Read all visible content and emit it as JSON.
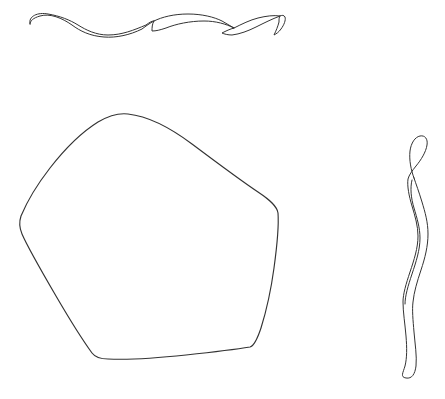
{
  "canvas": {
    "title": "Hand-drawn ink shapes",
    "width": 445,
    "height": 399,
    "background_color": "#ffffff",
    "ink_color": "#333333",
    "stroke_width": 1.15,
    "medium": "pen-line-drawing",
    "shape_count": 3
  },
  "shapes": [
    {
      "id": "looping-ribbon-horizontal",
      "name": "Horizontal looping ribbon",
      "description": "A chain of four elongated overlapping lens-shaped loops running left to right near the top of the canvas, beginning with a rounded bow at the left and ending in a small sharp hook at the right.",
      "closed": false,
      "bbox": {
        "x": 28,
        "y": 10,
        "width": 258,
        "height": 32
      },
      "loop_count": 4,
      "crossing_points_x": [
        78,
        152,
        210,
        272
      ],
      "path": "M 30 24 C 28 16, 38 12, 48 14 C 60 16, 70 20, 78 25 C 86 30, 96 35, 108 35 C 122 35, 134 30, 146 25 C 150 22, 152 21, 154 21 C 150 23, 146 26, 142 29 C 130 35, 116 38, 104 37 C 90 36, 80 31, 72 25 C 62 18, 50 13, 40 16 C 33 18, 30 21, 30 24 Z M 154 21 C 162 17, 174 14, 188 14 C 202 14, 214 17, 222 21 C 226 23, 230 26, 234 28 C 226 24, 216 21, 204 21 C 190 21, 176 24, 166 28 C 160 30, 156 31, 152 31 C 152 28, 152 24, 154 21 Z M 234 28 C 242 24, 250 20, 258 18 C 266 16, 274 15, 280 16 C 272 19, 264 23, 256 27 C 248 31, 240 34, 232 35 C 228 35, 224 34, 222 33 C 226 31, 230 29, 234 28 Z M 280 16 C 282 15, 284 15, 285 17 C 286 20, 284 25, 281 29 C 279 32, 276 34, 274 35 C 276 31, 278 26, 279 22 C 279 19, 279 17, 280 16 Z"
    },
    {
      "id": "rounded-pentagon",
      "name": "Large rounded pentagon",
      "description": "A large closed hand-drawn pentagon-like blob with five softly rounded corners: top apex, upper-left shoulder, upper-right shoulder, bottom-left corner and bottom-right corner.",
      "closed": true,
      "bbox": {
        "x": 20,
        "y": 112,
        "width": 260,
        "height": 250
      },
      "vertices": [
        {
          "label": "top-apex",
          "x": 128,
          "y": 114
        },
        {
          "label": "right-shoulder",
          "x": 278,
          "y": 210
        },
        {
          "label": "bottom-right",
          "x": 252,
          "y": 345
        },
        {
          "label": "bottom-left",
          "x": 100,
          "y": 359
        },
        {
          "label": "left-corner",
          "x": 20,
          "y": 222
        }
      ],
      "path": "M 128 114 C 146 116, 168 126, 192 144 C 216 162, 240 180, 258 192 C 270 200, 277 206, 278 213 C 279 226, 277 246, 274 268 C 271 290, 266 312, 261 328 C 257 340, 254 346, 250 347 C 238 349, 214 352, 186 355 C 158 358, 128 360, 108 359 C 100 359, 95 357, 92 353 C 84 342, 70 320, 56 296 C 42 272, 28 248, 22 234 C 19 227, 19 222, 21 216 C 26 204, 36 186, 50 168 C 64 150, 82 132, 98 122 C 110 115, 120 113, 128 114 Z"
    },
    {
      "id": "vertical-serpentine-ribbon",
      "name": "Vertical serpentine ribbon",
      "description": "A tall narrow S-curved double-line ribbon at the right edge of the canvas, topped by a small closed teardrop loop and closed at the bottom by a narrow U-turn.",
      "closed": false,
      "bbox": {
        "x": 398,
        "y": 133,
        "width": 32,
        "height": 245
      },
      "path": "M 414 178 C 411 170, 409 160, 410 151 C 411 143, 415 137, 420 136 C 425 135, 428 139, 427 145 C 426 152, 421 160, 416 166 C 412 171, 409 175, 408 179 C 407 186, 409 196, 412 206 C 415 216, 418 226, 418 236 C 418 248, 414 260, 410 272 C 406 284, 403 294, 403 302 C 403 312, 405 324, 406 336 C 407 348, 407 358, 405 366 C 403 373, 400 377, 406 378 C 412 379, 415 374, 416 366 C 417 356, 415 344, 414 332 C 413 320, 412 310, 413 302 C 414 292, 417 282, 421 270 C 425 258, 428 246, 428 234 C 428 222, 425 212, 422 202 C 419 192, 416 184, 414 178 Z M 412 180 C 410 188, 411 198, 414 208 C 417 218, 420 228, 420 238 C 420 250, 416 262, 412 274 C 408 286, 405 296, 405 304"
    }
  ]
}
